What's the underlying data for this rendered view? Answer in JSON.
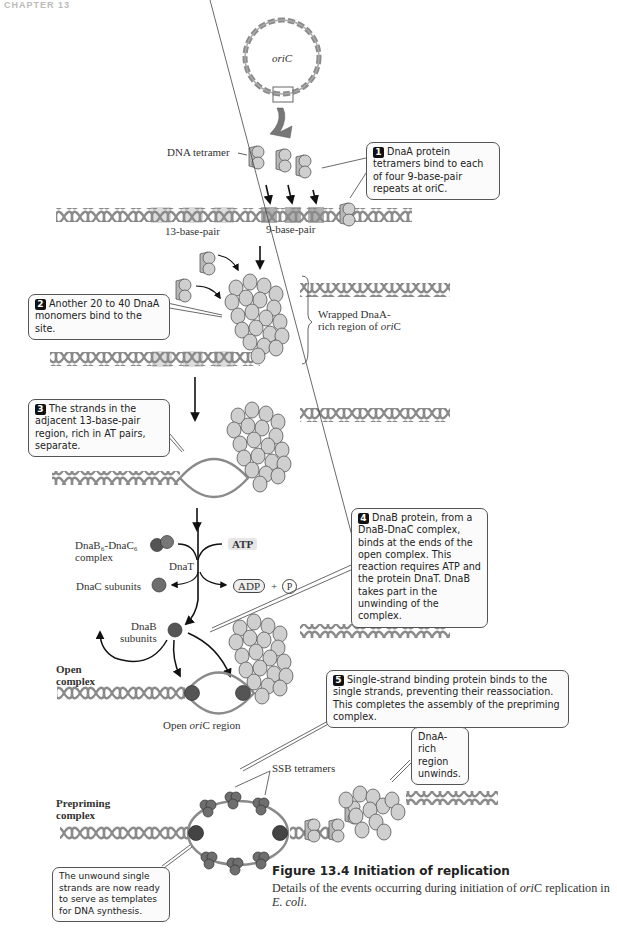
{
  "header": {
    "chapter_label": "CHAPTER 13"
  },
  "plasmid": {
    "label": "oriC"
  },
  "labels": {
    "dna_tetramer": "DNA tetramer",
    "thirteen_bp": "13-base-pair",
    "nine_bp": "9-base-pair",
    "wrapped_line1": "Wrapped DnaA-",
    "wrapped_line2_prefix": "rich region of ",
    "wrapped_line2_italic": "ori",
    "wrapped_line2_suffix": "C",
    "dnab_dnac_line1": "DnaB₆-DnaC₆",
    "dnab_dnac_line2": "complex",
    "dnat": "DnaT",
    "dnac_subunits": "DnaC subunits",
    "dnab_line1": "DnaB",
    "dnab_line2": "subunits",
    "atp": "ATP",
    "adp": "ADP",
    "plus": "+",
    "pi": "P",
    "open_complex_line1": "Open",
    "open_complex_line2": "complex",
    "open_oric_prefix": "Open ",
    "open_oric_italic": "ori",
    "open_oric_suffix": "C region",
    "ssb_tetramers": "SSB tetramers",
    "prepriming_line1": "Prepriming",
    "prepriming_line2": "complex"
  },
  "callouts": [
    {
      "step": "1",
      "text": "DnaA protein tetramers bind to each of four 9-base-pair repeats at oriC."
    },
    {
      "step": "2",
      "text": "Another 20 to 40 DnaA monomers bind to the site."
    },
    {
      "step": "3",
      "text": "The strands in the adjacent 13-base-pair region, rich in AT pairs, separate."
    },
    {
      "step": "4",
      "text": "DnaB protein, from a DnaB-DnaC complex, binds at the ends of the open complex. This reaction requires ATP and the protein DnaT. DnaB takes part in the unwinding of the complex."
    },
    {
      "step": "5",
      "text": "Single-strand binding protein binds to the single strands, preventing their reassociation. This completes the assembly of the prepriming complex."
    },
    {
      "step": "",
      "text": "DnaA-rich region unwinds."
    },
    {
      "step": "",
      "text": "The unwound single strands are now ready to serve as templates for DNA synthesis."
    }
  ],
  "caption": {
    "title": "Figure 13.4  Initiation of replication",
    "body_prefix": "Details of the events occurring during initiation of ",
    "body_italic1": "ori",
    "body_mid": "C replication in ",
    "body_italic2": "E. coli",
    "body_suffix": "."
  },
  "colors": {
    "dna": "#8a8a8a",
    "dnaa_protein": "#cfcfcf",
    "dnab_protein": "#555555",
    "ssb_protein": "#6e6e6e",
    "highlight_13bp": "#dcdcdc",
    "highlight_9bp": "#b0b0b0",
    "callout_bg": "#fbfbfb"
  }
}
